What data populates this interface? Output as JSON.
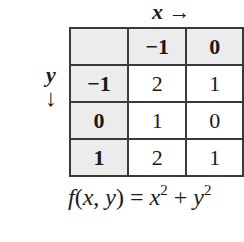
{
  "axis_labels": {
    "x": {
      "var": "x",
      "arrow": "→"
    },
    "y": {
      "var": "y",
      "arrow": "↓"
    }
  },
  "table": {
    "corner": "",
    "x_headers": [
      "−1",
      "0"
    ],
    "rows": [
      {
        "y": "−1",
        "values": [
          "2",
          "1"
        ]
      },
      {
        "y": "0",
        "values": [
          "1",
          "0"
        ]
      },
      {
        "y": "1",
        "values": [
          "2",
          "1"
        ]
      }
    ]
  },
  "formula": {
    "f": "f",
    "args_open": "(",
    "x": "x",
    "comma": ", ",
    "y": "y",
    "args_close": ") = ",
    "term1": "x",
    "exp1": "2",
    "plus": " + ",
    "term2": "y",
    "exp2": "2"
  },
  "colors": {
    "header_bg": "#ececec",
    "border": "#3a3a3a"
  }
}
